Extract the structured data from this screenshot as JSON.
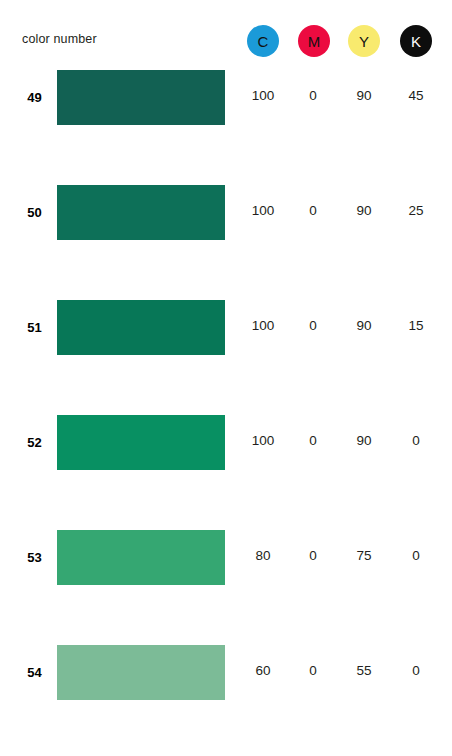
{
  "header": {
    "label": "color number",
    "inks": [
      {
        "key": "C",
        "name": "cyan",
        "letter": "C",
        "circle_color": "#1b9ad8",
        "text_color": "#111111"
      },
      {
        "key": "M",
        "name": "magenta",
        "letter": "M",
        "circle_color": "#ec0b40",
        "text_color": "#111111"
      },
      {
        "key": "Y",
        "name": "yellow",
        "letter": "Y",
        "circle_color": "#f8ea6e",
        "text_color": "#111111"
      },
      {
        "key": "K",
        "name": "black",
        "letter": "K",
        "circle_color": "#0d0d0d",
        "text_color": "#ffffff"
      }
    ]
  },
  "chart_data": {
    "type": "table",
    "title": "color number",
    "columns": [
      "color number",
      "swatch",
      "C",
      "M",
      "Y",
      "K"
    ],
    "rows": [
      {
        "number": "49",
        "swatch_color": "#126153",
        "c": "100",
        "m": "0",
        "y": "90",
        "k": "45"
      },
      {
        "number": "50",
        "swatch_color": "#0d7058",
        "c": "100",
        "m": "0",
        "y": "90",
        "k": "25"
      },
      {
        "number": "51",
        "swatch_color": "#077757",
        "c": "100",
        "m": "0",
        "y": "90",
        "k": "15"
      },
      {
        "number": "52",
        "swatch_color": "#089062",
        "c": "100",
        "m": "0",
        "y": "90",
        "k": "0"
      },
      {
        "number": "53",
        "swatch_color": "#35a772",
        "c": "80",
        "m": "0",
        "y": "75",
        "k": "0"
      },
      {
        "number": "54",
        "swatch_color": "#7cbb97",
        "c": "60",
        "m": "0",
        "y": "55",
        "k": "0"
      }
    ]
  },
  "page": {
    "background": "#ffffff"
  }
}
